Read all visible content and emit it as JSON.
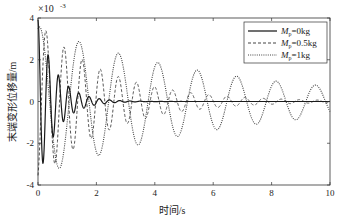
{
  "chart_data": {
    "type": "line",
    "title": "",
    "xlabel": "时间/s",
    "ylabel": "末端变形位移量/m",
    "y_multiplier_label": "×10⁻³",
    "xlim": [
      0,
      10
    ],
    "ylim": [
      -4,
      4
    ],
    "xticks": [
      "0",
      "2",
      "4",
      "6",
      "8",
      "10"
    ],
    "yticks": [
      "4",
      "2",
      "0",
      "-2",
      "-4"
    ],
    "grid": false,
    "legend_position": "upper right",
    "legend": [
      {
        "label": "Mp=0kg",
        "style": "solid"
      },
      {
        "label": "Mp=0.5kg",
        "style": "dashed"
      },
      {
        "label": "Mp=1kg",
        "style": "dotted"
      }
    ],
    "series": [
      {
        "name": "Mp=0kg",
        "style": "solid",
        "model": {
          "amplitude": 3.9,
          "decay": 1.6,
          "period": 0.35,
          "phase": 1.57
        },
        "x": [
          0,
          0.1,
          0.2,
          0.3,
          0.5,
          1.0,
          1.5,
          2.0,
          3.0,
          5.0,
          10.0
        ],
        "values": [
          3.9,
          -3.0,
          1.5,
          -1.4,
          -0.3,
          0.6,
          0.2,
          0.05,
          0.02,
          0.0,
          0.0
        ]
      },
      {
        "name": "Mp=0.5kg",
        "style": "dashed",
        "model": {
          "amplitude": 3.8,
          "decay": 0.42,
          "period": 0.62,
          "phase": -1.2
        },
        "x": [
          0,
          0.2,
          0.5,
          0.8,
          1.1,
          1.5,
          2.0,
          3.0,
          4.0,
          6.0,
          8.0,
          10.0
        ],
        "values": [
          -3.0,
          3.3,
          -3.3,
          2.4,
          -2.2,
          1.2,
          0.9,
          0.6,
          0.4,
          0.2,
          0.1,
          0.05
        ]
      },
      {
        "name": "Mp=1kg",
        "style": "dotted",
        "model": {
          "amplitude": 3.6,
          "decay": 0.16,
          "period": 1.35,
          "phase": 1.3
        },
        "x": [
          0,
          0.35,
          1.0,
          1.7,
          2.4,
          3.1,
          4.5,
          5.2,
          6.0,
          6.6,
          7.3,
          8.7,
          10.0
        ],
        "values": [
          -2.0,
          3.3,
          -3.6,
          2.5,
          -2.4,
          2.0,
          1.6,
          -1.4,
          1.2,
          -1.0,
          0.9,
          0.5,
          0.4
        ]
      }
    ]
  },
  "axes": {
    "y_multiplier": "×10",
    "y_exponent": "-3",
    "xlabel": "时间/s",
    "ylabel": "末端变形位移量/m"
  },
  "legend": {
    "items": [
      {
        "symbol": "M",
        "sub": "p",
        "value": "=0kg"
      },
      {
        "symbol": "M",
        "sub": "p",
        "value": "=0.5kg"
      },
      {
        "symbol": "M",
        "sub": "p",
        "value": "=1kg"
      }
    ]
  }
}
